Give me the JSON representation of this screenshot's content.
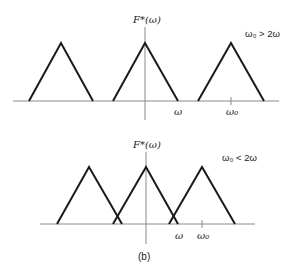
{
  "panels": [
    {
      "id": "top",
      "y_label": "F*(ω)",
      "condition": "ω₀ > 2ω",
      "tick_labels": [
        "ω",
        "ω₀"
      ],
      "axis_y": 101,
      "apex_y": 43,
      "triangles": [
        {
          "left": 29,
          "apex": 61,
          "right": 93
        },
        {
          "left": 113,
          "apex": 145,
          "right": 178
        },
        {
          "left": 198,
          "apex": 231,
          "right": 264
        }
      ]
    },
    {
      "id": "bottom",
      "y_label": "F*(ω)",
      "condition": "ω₀ < 2ω",
      "tick_labels": [
        "ω",
        "ω₀"
      ],
      "axis_y": 224,
      "apex_y": 167,
      "triangles": [
        {
          "left": 57,
          "apex": 89,
          "right": 122
        },
        {
          "left": 113,
          "apex": 146,
          "right": 178
        },
        {
          "left": 169,
          "apex": 202,
          "right": 235
        }
      ]
    }
  ],
  "caption": "(b)",
  "colors": {
    "line": "#1a1a1a",
    "axis": "#8a8a8a"
  }
}
